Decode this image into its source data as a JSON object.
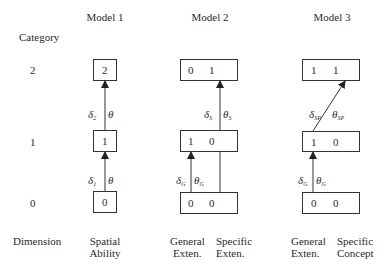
{
  "models": [
    {
      "title": "Model 1"
    },
    {
      "title": "Model 2"
    },
    {
      "title": "Model 3"
    }
  ],
  "axis": {
    "category_label": "Category",
    "dimension_label": "Dimension",
    "levels": [
      "2",
      "1",
      "0"
    ]
  },
  "model1": {
    "boxes": {
      "level2": "2",
      "level1": "1",
      "level0": "0"
    },
    "arrows": {
      "upper": {
        "delta": "δ",
        "delta_sub": "2",
        "theta": "θ",
        "theta_sub": ""
      },
      "lower": {
        "delta": "δ",
        "delta_sub": "1",
        "theta": "θ",
        "theta_sub": ""
      }
    },
    "dimension": [
      "Spatial",
      "Ability"
    ]
  },
  "model2": {
    "boxes": {
      "level2": [
        "0",
        "1"
      ],
      "level1": [
        "1",
        "0"
      ],
      "level0": [
        "0",
        "0"
      ]
    },
    "arrows": {
      "upper": {
        "delta": "δ",
        "delta_sub": "S",
        "theta": "θ",
        "theta_sub": "S"
      },
      "lower": {
        "delta": "δ",
        "delta_sub": "G",
        "theta": "θ",
        "theta_sub": "G"
      }
    },
    "dimensions": [
      [
        "General",
        "Exten."
      ],
      [
        "Specific",
        "Exten."
      ]
    ]
  },
  "model3": {
    "boxes": {
      "level2": [
        "1",
        "1"
      ],
      "level1": [
        "1",
        "0"
      ],
      "level0": [
        "0",
        "0"
      ]
    },
    "arrows": {
      "upper": {
        "delta": "δ",
        "delta_sub": "SP",
        "theta": "θ",
        "theta_sub": "SP"
      },
      "lower": {
        "delta": "δ",
        "delta_sub": "G",
        "theta": "θ",
        "theta_sub": "G"
      }
    },
    "dimensions": [
      [
        "General",
        "Exten."
      ],
      [
        "Specific",
        "Concept"
      ]
    ]
  }
}
